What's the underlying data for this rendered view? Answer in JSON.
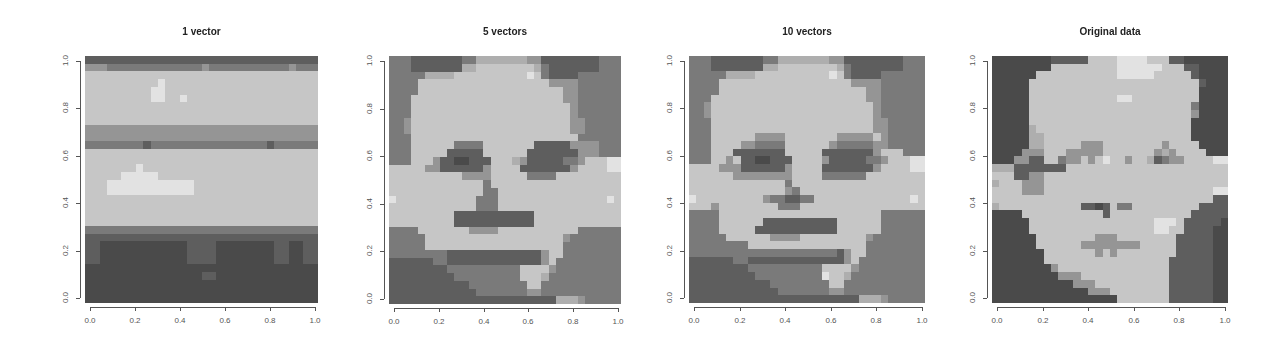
{
  "chart_data": [
    {
      "type": "heatmap",
      "title": "1 vector",
      "xlabel": "",
      "ylabel": "",
      "xlim": [
        0,
        1
      ],
      "ylim": [
        0,
        1
      ],
      "x_ticks": [
        "0.0",
        "0.2",
        "0.4",
        "0.6",
        "0.8",
        "1.0"
      ],
      "y_ticks": [
        "0.0",
        "0.2",
        "0.4",
        "0.6",
        "0.8",
        "1.0"
      ],
      "colormap": "grayscale",
      "grid_rows": [
        "33333333333333333333333333333333",
        "55544444444444445444444444445444",
        "77777777777777777777777777777777",
        "77777777778777777777777777777777",
        "77777777788777777777777777777777",
        "77777777788778777777777777777777",
        "77777777777777777777777777777777",
        "77777777777777777777777777777777",
        "77777777777777777777777777777777",
        "55555555555555555555555555555555",
        "55555555555555555555555555555555",
        "44444444344444444444444443444444",
        "77777777777777777777777777777777",
        "77777777777777777777777777777777",
        "77777778777777777777777777777777",
        "77777888887777777777777777777777",
        "77788888888888877777777777777777",
        "77788888888888877777777777777777",
        "77777777777777777777777777777777",
        "77777777777777777777777777777777",
        "77777777777777777777777777777777",
        "77777777777777777777777777777777",
        "44444444444444444444444444444444",
        "33333333333333333333333333333333",
        "33222222222222333322222222332233",
        "33222222222222333322222222332233",
        "33222222222222333322222222332233",
        "22222222222222222222222222222222",
        "22222222222222223322222222222222",
        "22222222222222222222222222222222",
        "22222222222222222222222222222222",
        "22222222222222222222222222222222"
      ]
    },
    {
      "type": "heatmap",
      "title": "5 vectors",
      "xlabel": "",
      "ylabel": "",
      "xlim": [
        0,
        1
      ],
      "ylim": [
        0,
        1
      ],
      "x_ticks": [
        "0.0",
        "0.2",
        "0.4",
        "0.6",
        "0.8",
        "1.0"
      ],
      "y_ticks": [
        "0.0",
        "0.2",
        "0.4",
        "0.6",
        "0.8",
        "1.0"
      ],
      "colormap": "grayscale",
      "grid_rows": [
        "44433333334466666665533333333444",
        "44433333336677777777643333333444",
        "44444666677777777778743333444444",
        "44447777777777777777775555444444",
        "44447777777777777777777755444444",
        "44477777777777777777777755444444",
        "44477777777777777777777775444444",
        "44477777777777777777777775444444",
        "44577777777777777777777775544444",
        "44577777777777777777777775544444",
        "44477777777777777777777777444444",
        "44477777744447777777333335555444",
        "44477777333337777773333333555444",
        "44477753322333777653333344577788",
        "77777553333335777733333335777788",
        "77777777775555777774444777777777",
        "77777777777774777777777777777777",
        "77777777777774477777777777777777",
        "87777777777744477777777777777787",
        "77777777777744477777777777777777",
        "77777777733333333333777777777777",
        "77777777733333333333777777777777",
        "44447777777555577777777777444444",
        "44444777777777777777777754444444",
        "44444777777777777777777744444444",
        "44444444333333333333357744444444",
        "33333344333333333333357444444444",
        "33333333444444444477775444444444",
        "33333333344444444477764444444444",
        "33333333333444444447744444444444",
        "33333333333344444445544444444444",
        "33333333333333333333333666544444"
      ]
    },
    {
      "type": "heatmap",
      "title": "10 vectors",
      "xlabel": "",
      "ylabel": "",
      "xlim": [
        0,
        1
      ],
      "ylim": [
        0,
        1
      ],
      "x_ticks": [
        "0.0",
        "0.2",
        "0.4",
        "0.6",
        "0.8",
        "1.0"
      ],
      "y_ticks": [
        "0.0",
        "0.2",
        "0.4",
        "0.6",
        "0.8",
        "1.0"
      ],
      "colormap": "grayscale",
      "grid_rows": [
        "44433333334466666665533333333444",
        "44433333336677777777643333333444",
        "44444666677777777778743333444444",
        "44447777777777777777775555444444",
        "44447777777777777777777755444444",
        "44477777777777777777777755444444",
        "44577777777777777777777775444444",
        "44577777777777777777777775444444",
        "44477777777777777777777775544444",
        "44477777777777777777777775544444",
        "44477777755557777777555557544444",
        "44477775544447777775444445544444",
        "44477733333337777733333335777444",
        "44477573322333777753333344577788",
        "77775553333335777733333335777788",
        "77777755555555777744444477777777",
        "77777777777774777777777777777777",
        "77777777777775477777777777777777",
        "87777777775443344777777777777787",
        "77757777777744477777777777777777",
        "44447777777777777777777777444444",
        "44447777773333333333777777444444",
        "44447777733333333333777777444444",
        "44444777777555577777777754444444",
        "44444444777777777777777744444444",
        "44444444444444444444357744444444",
        "33333344333333333333357444444444",
        "33333333444444444477775444444444",
        "33333333344444444487764444444444",
        "33333333333444444447744444444444",
        "33333333333344444445544444444444",
        "33333333333333333333333666544444"
      ]
    },
    {
      "type": "heatmap",
      "title": "Original data",
      "xlabel": "",
      "ylabel": "",
      "xlim": [
        0,
        1
      ],
      "ylim": [
        0,
        1
      ],
      "x_ticks": [
        "0.0",
        "0.2",
        "0.4",
        "0.6",
        "0.8",
        "1.0"
      ],
      "y_ticks": [
        "0.0",
        "0.2",
        "0.4",
        "0.6",
        "0.8",
        "1.0"
      ],
      "colormap": "grayscale",
      "grid_rows": [
        "22222222333337777888877733222222",
        "22222222777777777888888777332222",
        "22222277777777777888887777732222",
        "22222777777777777777777777773222",
        "22222777777777777777777777772222",
        "22222777777777777887777777772222",
        "22222777777777777777777777742222",
        "22222777777777777777777777752222",
        "22222777777777777777777777722222",
        "22222677777777777777777777722222",
        "22222667777777777777777777722222",
        "22222667777755577777777577772222",
        "22225557775555577777775657777222",
        "22255337745575787757763455777788",
        "66633333337777777777777777777777",
        "77733557777777777777777777777777",
        "67775557777777777777777777777777",
        "77775557777777777777777777777788",
        "77777777777777777777777777777733",
        "67777777777733237447777777773333",
        "22227777777777737777777777733333",
        "22222777777777777777778887333332",
        "22222777777777777777778877333322",
        "22222277777777555777777773333322",
        "22222277777755555555777773333322",
        "22222227777777575777777773333322",
        "22222227777777777777777733333322",
        "22222222577777777777777733333322",
        "22222222255577777777777733333322",
        "22222222222555777777777733333322",
        "22222222222225557777777733333322",
        "22222222222222222777777733333322"
      ]
    }
  ],
  "palette": {
    "0": "#1e1e1e",
    "1": "#333333",
    "2": "#4a4a4a",
    "3": "#5e5e5e",
    "4": "#7a7a7a",
    "5": "#959595",
    "6": "#aeaeae",
    "7": "#c6c6c6",
    "8": "#e2e2e2",
    "9": "#f4f4f4"
  }
}
